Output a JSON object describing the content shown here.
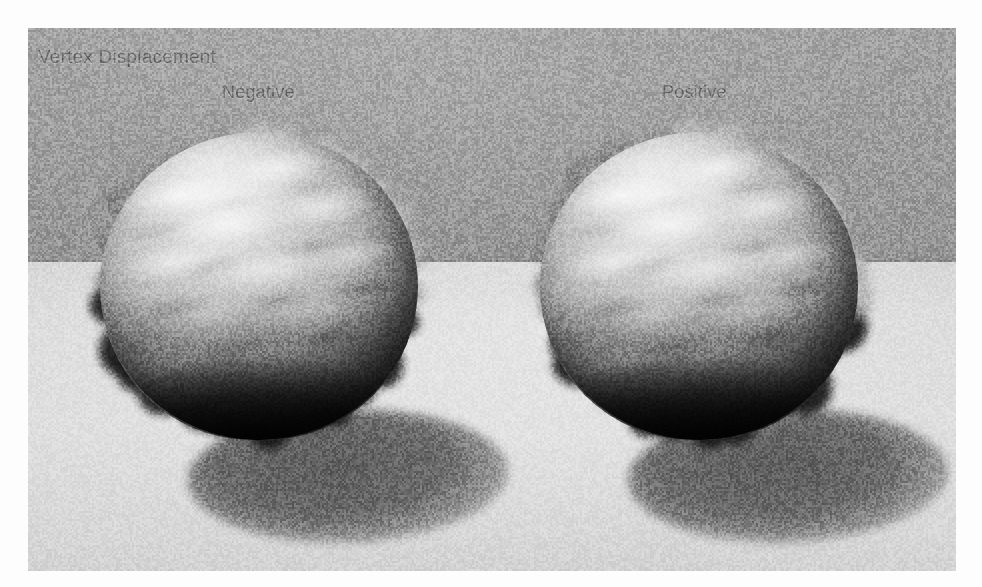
{
  "render": {
    "title": "Vertex Displacement",
    "labels": {
      "left": "Negative",
      "right": "Positive"
    },
    "colors": {
      "wall": "#9a9a9a",
      "floor": "#dcdcdc",
      "shadow": "#606060",
      "text": "#6d6d6d",
      "sphere_highlight": "#e8e8e8",
      "sphere_shadow": "#111111"
    },
    "objects": [
      {
        "name": "displaced-sphere-negative",
        "label": "Negative",
        "displacement_sign": "negative",
        "surface": "organic lobed blobs"
      },
      {
        "name": "displaced-sphere-positive",
        "label": "Positive",
        "displacement_sign": "positive",
        "surface": "organic lobed blobs"
      }
    ]
  }
}
